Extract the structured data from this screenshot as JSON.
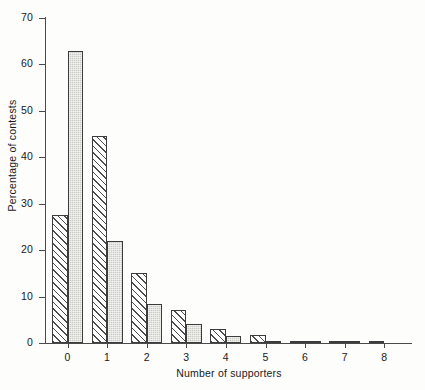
{
  "chart_data": {
    "type": "bar",
    "title": "",
    "subtitle": "",
    "xlabel": "Number of supporters",
    "ylabel": "Percentage of contests",
    "categories": [
      "0",
      "1",
      "2",
      "3",
      "4",
      "5",
      "6",
      "7",
      "8"
    ],
    "series": [
      {
        "name": "hatched",
        "style": "diagonal-hatch",
        "values": [
          27.5,
          44.5,
          15.0,
          7.2,
          3.0,
          1.7,
          0.4,
          0.4,
          0.2
        ]
      },
      {
        "name": "shaded",
        "style": "grey-stipple",
        "values": [
          63.0,
          22.0,
          8.5,
          4.0,
          1.5,
          0.4,
          0.3,
          0.3,
          0.0
        ]
      }
    ],
    "ylim": [
      0,
      70
    ],
    "y_ticks": [
      0,
      10,
      20,
      30,
      40,
      50,
      60,
      70
    ],
    "y_tick_labels": [
      "0",
      "10",
      "20",
      "30",
      "40",
      "50",
      "60",
      "70"
    ],
    "x_ticks": [
      0,
      1,
      2,
      3,
      4,
      5,
      6,
      7,
      8
    ],
    "x_tick_labels": [
      "0",
      "1",
      "2",
      "3",
      "4",
      "5",
      "6",
      "7",
      "8"
    ],
    "grid": false,
    "legend": false,
    "legend_position": "none",
    "annotations": [],
    "colors": {
      "axis": "#4a4a4a",
      "bar_outline": "#3c3c3c",
      "hatch_line": "#4d4d4d",
      "shaded_fill": "#cbcbc6",
      "background": "#fdfdfc",
      "text": "#1a1a1a"
    }
  }
}
